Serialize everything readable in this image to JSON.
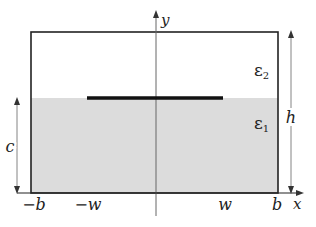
{
  "diagram": {
    "colors": {
      "background": "#ffffff",
      "outline": "#222222",
      "substrate_fill": "#dcdcdc",
      "strip": "#111111",
      "axis": "#555555"
    },
    "regions": {
      "upper": {
        "label": "ε",
        "subscript": "2"
      },
      "lower": {
        "label": "ε",
        "subscript": "1"
      }
    },
    "axes": {
      "x_label": "x",
      "y_label": "y"
    },
    "ticks": {
      "neg_b": "−b",
      "neg_w": "−w",
      "w": "w",
      "b": "b"
    },
    "dimensions": {
      "c": "c",
      "h": "h"
    }
  }
}
